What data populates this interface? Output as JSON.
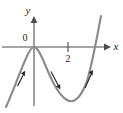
{
  "figure": {
    "type": "math-graph",
    "background_color": "#ffffff",
    "curve_color": "#8a8a8a",
    "axis_color": "#4d4d4d",
    "text_color": "#1a1a1a"
  },
  "axes": {
    "x": {
      "label": "x",
      "arrow": "right-arrow-icon",
      "y_pixel": 47,
      "x_start": 2,
      "x_end": 107
    },
    "y": {
      "label": "y",
      "arrow": "up-arrow-icon",
      "x_pixel": 34,
      "y_start": 16,
      "y_end": 106
    },
    "origin_label": "0"
  },
  "ticks": [
    {
      "label": "2",
      "x_pixel": 68,
      "axis": "x"
    }
  ],
  "curve": {
    "name": "cubic-curve",
    "path": "M 6,107 C 13,92 22,66 28,54 C 31,48 33,47 34,47 C 37,47 40,53 44,62 C 51,79 58,95 67,100 C 74,104 80,98 86,84 C 91,70 96,43 101,16",
    "stroke_width": 2.1
  },
  "direction_arrows": [
    {
      "name": "direction-arrow-left",
      "tip_x": 25,
      "tip_y": 72,
      "tail_x": 18,
      "tail_y": 86
    },
    {
      "name": "direction-arrow-middle",
      "tip_x": 60,
      "tip_y": 89,
      "tail_x": 51,
      "tail_y": 71
    },
    {
      "name": "direction-arrow-right",
      "tip_x": 93,
      "tip_y": 70,
      "tail_x": 85,
      "tail_y": 88
    }
  ],
  "chart_data": {
    "type": "line",
    "title": "",
    "xlabel": "x",
    "ylabel": "y",
    "grid": false,
    "legend": null,
    "xticks": [
      "2"
    ],
    "yticks": [],
    "annotations": [
      "0"
    ],
    "series": [
      {
        "name": "cubic-curve",
        "points": [
          [
            -1.6,
            -3.9
          ],
          [
            -1.2,
            -2.3
          ],
          [
            -0.8,
            -1.1
          ],
          [
            -0.4,
            -0.3
          ],
          [
            0.0,
            0.0
          ],
          [
            0.4,
            -0.3
          ],
          [
            0.8,
            -1.1
          ],
          [
            1.2,
            -2.1
          ],
          [
            1.6,
            -3.0
          ],
          [
            2.0,
            -3.7
          ],
          [
            2.4,
            -4.0
          ],
          [
            2.8,
            -3.8
          ],
          [
            3.2,
            -3.0
          ],
          [
            3.6,
            -1.6
          ],
          [
            4.0,
            0.4
          ],
          [
            4.4,
            3.1
          ]
        ]
      }
    ]
  }
}
